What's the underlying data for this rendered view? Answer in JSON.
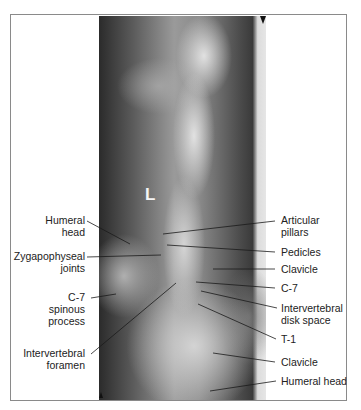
{
  "figure": {
    "type": "radiograph",
    "view": "cervicothoracic spine (swimmer's lateral)",
    "side_marker": "L",
    "labels_left": [
      {
        "id": "humeral-head-left",
        "text": "Humeral\nhead"
      },
      {
        "id": "zygapophyseal-joints",
        "text": "Zygapophyseal\njoints"
      },
      {
        "id": "c7-spinous-process",
        "text": "C-7\nspinous\nprocess"
      },
      {
        "id": "intervertebral-foramen",
        "text": "Intervertebral\nforamen"
      }
    ],
    "labels_right": [
      {
        "id": "articular-pillars",
        "text": "Articular\npillars"
      },
      {
        "id": "pedicles",
        "text": "Pedicles"
      },
      {
        "id": "clavicle-upper",
        "text": "Clavicle"
      },
      {
        "id": "c7",
        "text": "C-7"
      },
      {
        "id": "intervertebral-disk-space",
        "text": "Intervertebral\ndisk space"
      },
      {
        "id": "t1",
        "text": "T-1"
      },
      {
        "id": "clavicle-lower",
        "text": "Clavicle"
      },
      {
        "id": "humeral-head-right",
        "text": "Humeral head"
      }
    ]
  }
}
